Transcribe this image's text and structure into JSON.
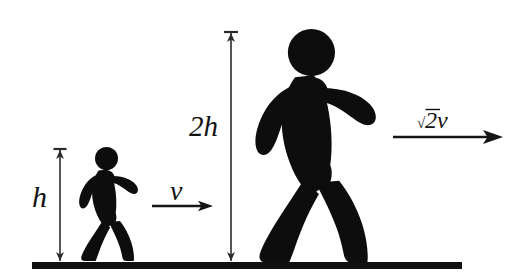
{
  "figure": {
    "background_color": "#ffffff",
    "ink_color": "#0d0d0d",
    "ground": {
      "name": "ground-line",
      "x_start": 32,
      "x_end": 462,
      "y": 262,
      "thickness": 7,
      "color": "#111111"
    },
    "dimensions": [
      {
        "id": "small-height",
        "label": "h",
        "label_x": 34,
        "label_y": 205,
        "line_x": 60,
        "y_top": 150,
        "y_bottom": 261,
        "cap_width": 13
      },
      {
        "id": "large-height",
        "label": "2h",
        "label_x": 190,
        "label_y": 135,
        "line_x": 231,
        "y_top": 33,
        "y_bottom": 261,
        "cap_width": 14
      }
    ],
    "vectors": [
      {
        "id": "small-velocity",
        "label": "v",
        "label_prefix": "",
        "label_x": 172,
        "label_y": 198,
        "x_start": 152,
        "x_end": 213,
        "y": 206,
        "head_length": 13,
        "head_width": 9
      },
      {
        "id": "large-velocity",
        "label": "2v",
        "label_prefix": "√",
        "label_full": "√2v",
        "label_x": 421,
        "label_y": 127,
        "x_start": 393,
        "x_end": 503,
        "y": 137,
        "head_length": 18,
        "head_width": 12
      }
    ],
    "figures": [
      {
        "id": "small-walker",
        "name": "small-walking-person",
        "height_label": "h",
        "velocity_label": "v",
        "scale": 1.0,
        "base_x": 108,
        "base_y": 261
      },
      {
        "id": "large-walker",
        "name": "large-walking-person",
        "height_label": "2h",
        "velocity_label": "√2v",
        "scale": 2.05,
        "base_x": 318,
        "base_y": 261
      }
    ]
  }
}
